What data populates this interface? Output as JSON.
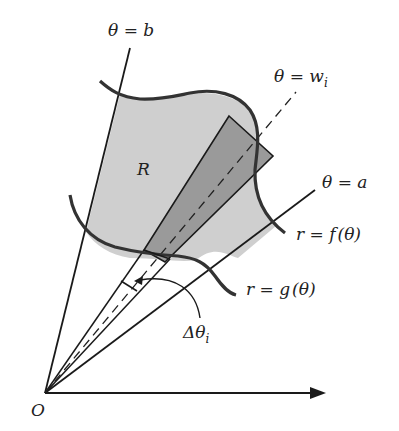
{
  "diagram": {
    "type": "polar region area element",
    "colors": {
      "region_fill": "#cfcfcf",
      "element_fill": "#9a9a9a",
      "line": "#1a1a1a",
      "curve": "#333333",
      "background": "#ffffff"
    },
    "labels": {
      "theta_b": {
        "var": "θ",
        "eq": " = ",
        "val": "b"
      },
      "theta_wi": {
        "var": "θ",
        "eq": " = ",
        "val": "w",
        "sub": "i"
      },
      "theta_a": {
        "var": "θ",
        "eq": " = ",
        "val": "a"
      },
      "region": "R",
      "outer_curve": {
        "r": "r",
        "eq": " = ",
        "fn": "f",
        "arg": "(θ)"
      },
      "inner_curve": {
        "r": "r",
        "eq": " = ",
        "fn": "g",
        "arg": "(θ)"
      },
      "delta_theta": {
        "delta": "Δ",
        "var": "θ",
        "sub": "i"
      },
      "origin": "O"
    }
  }
}
